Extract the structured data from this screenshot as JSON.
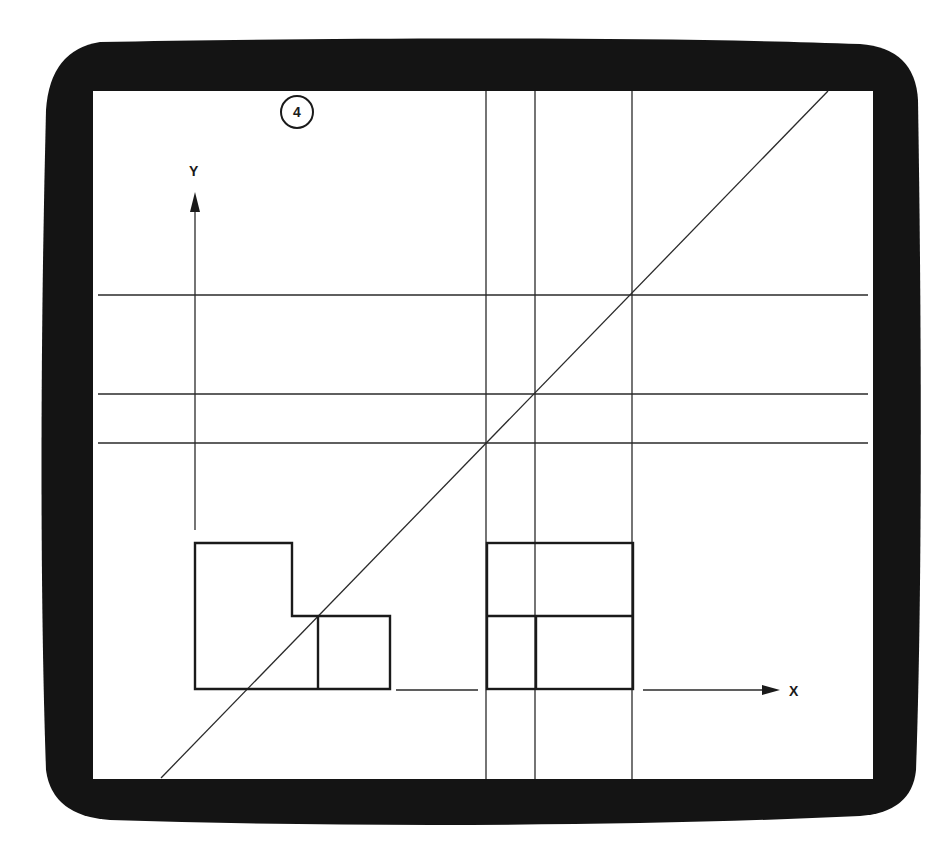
{
  "figure": {
    "badge_number": "4",
    "axis_labels": {
      "y": "Y",
      "x": "X"
    },
    "colors": {
      "frame": "#141414",
      "screen": "#ffffff",
      "lines": "#2a2a2a",
      "shapes": "#1a1a1a"
    }
  }
}
